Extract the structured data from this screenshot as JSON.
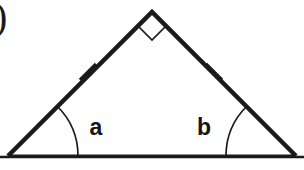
{
  "figure": {
    "name": "isosceles-right-triangle-diagram",
    "background_color": "#ffffff",
    "stroke_color": "#1a1a1a",
    "canvas": {
      "width": 304,
      "height": 170
    },
    "corner_mark": {
      "text": ")",
      "x": 2,
      "y": 18
    },
    "triangle": {
      "apex": {
        "x": 152,
        "y": 12
      },
      "left_vertex": {
        "x": 8,
        "y": 156
      },
      "right_vertex": {
        "x": 296,
        "y": 156
      },
      "side_stroke_width": 4.5
    },
    "baseline": {
      "x1": 0,
      "y1": 157,
      "x2": 304,
      "y2": 157,
      "stroke_width": 2.5
    },
    "right_angle_marker": {
      "label": "right-angle-square",
      "size": 20,
      "stroke_width": 1.6
    },
    "tick_marks": [
      {
        "label": "left-side-congruence-tick",
        "cx": 88,
        "cy": 72,
        "length": 17,
        "stroke_width": 3
      },
      {
        "label": "right-side-congruence-tick",
        "cx": 214,
        "cy": 72,
        "length": 17,
        "stroke_width": 3
      }
    ],
    "angle_arcs": [
      {
        "label": "angle-arc-a",
        "vertex_x": 8,
        "vertex_y": 156,
        "radius": 70,
        "stroke_width": 1.6
      },
      {
        "label": "angle-arc-b",
        "vertex_x": 296,
        "vertex_y": 156,
        "radius": 70,
        "stroke_width": 1.6
      }
    ],
    "angle_labels": [
      {
        "text": "a",
        "x": 96,
        "y": 129
      },
      {
        "text": "b",
        "x": 204,
        "y": 129
      }
    ]
  }
}
